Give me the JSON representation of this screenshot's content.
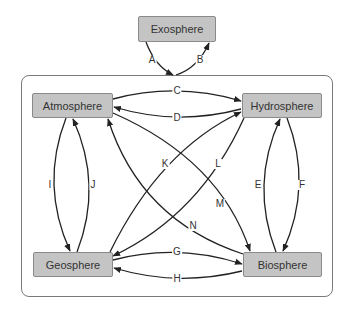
{
  "diagram": {
    "colors": {
      "box_fill": "#c4c4c4",
      "box_border": "#8a8a8a",
      "line": "#222222",
      "container_border": "#7a7a7a"
    },
    "nodes": {
      "exosphere": "Exosphere",
      "atmosphere": "Atmosphere",
      "hydrosphere": "Hydrosphere",
      "geosphere": "Geosphere",
      "biosphere": "Biosphere"
    },
    "edges": [
      {
        "label": "A",
        "from": "Exosphere",
        "to": "Earth system (container)"
      },
      {
        "label": "B",
        "from": "Earth system (container)",
        "to": "Exosphere"
      },
      {
        "label": "C",
        "from": "Atmosphere",
        "to": "Hydrosphere"
      },
      {
        "label": "D",
        "from": "Hydrosphere",
        "to": "Atmosphere"
      },
      {
        "label": "E",
        "from": "Biosphere",
        "to": "Hydrosphere"
      },
      {
        "label": "F",
        "from": "Hydrosphere",
        "to": "Biosphere"
      },
      {
        "label": "G",
        "from": "Geosphere",
        "to": "Biosphere"
      },
      {
        "label": "H",
        "from": "Biosphere",
        "to": "Geosphere"
      },
      {
        "label": "I",
        "from": "Atmosphere",
        "to": "Geosphere"
      },
      {
        "label": "J",
        "from": "Geosphere",
        "to": "Atmosphere"
      },
      {
        "label": "K",
        "from": "Geosphere",
        "to": "Hydrosphere"
      },
      {
        "label": "L",
        "from": "Hydrosphere",
        "to": "Geosphere"
      },
      {
        "label": "M",
        "from": "Atmosphere",
        "to": "Biosphere"
      },
      {
        "label": "N",
        "from": "Biosphere",
        "to": "Atmosphere"
      }
    ],
    "labels": {
      "A": "A",
      "B": "B",
      "C": "C",
      "D": "D",
      "E": "E",
      "F": "F",
      "G": "G",
      "H": "H",
      "I": "I",
      "J": "J",
      "K": "K",
      "L": "L",
      "M": "M",
      "N": "N"
    }
  }
}
